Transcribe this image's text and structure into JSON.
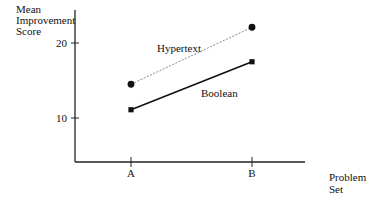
{
  "chart_data": {
    "type": "line",
    "title": "",
    "xlabel": "Problem Set",
    "ylabel": "Mean Improvement Score",
    "ylabel_lines": [
      "Mean",
      "Improvement",
      "Score"
    ],
    "xlabel_lines": [
      "Problem",
      "Set"
    ],
    "categories": [
      "A",
      "B"
    ],
    "series": [
      {
        "name": "Hypertext",
        "values": [
          14.5,
          22.1
        ],
        "marker": "circle",
        "line_style": "dotted",
        "color": "#888888"
      },
      {
        "name": "Boolean",
        "values": [
          11.1,
          17.5
        ],
        "marker": "square",
        "line_style": "solid",
        "color": "#111111"
      }
    ],
    "yticks": [
      10,
      20
    ],
    "ylim": [
      4,
      24.5
    ],
    "grid": false,
    "legend": "inline labels near lines",
    "annotations": [
      {
        "text": "Hypertext",
        "near": "Hypertext line"
      },
      {
        "text": "Boolean",
        "near": "Boolean line"
      }
    ]
  }
}
